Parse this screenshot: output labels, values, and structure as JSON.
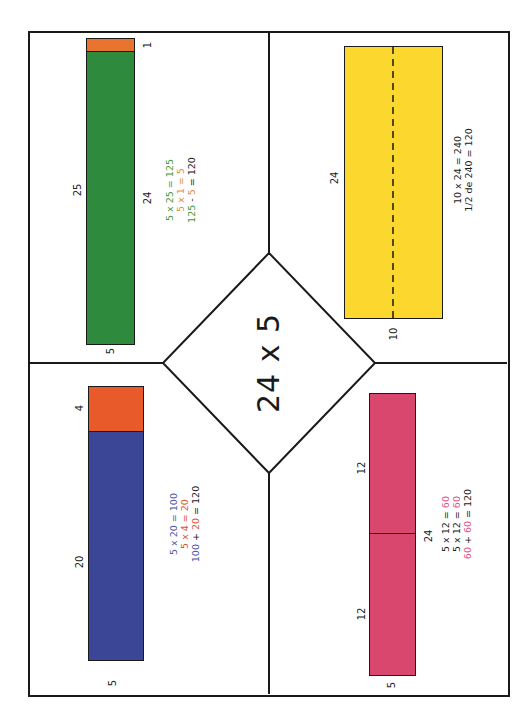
{
  "title": "24 x 5",
  "colors": {
    "green": "#2e8b3e",
    "orange": "#e8742e",
    "blue": "#3b4796",
    "red_orange": "#e85a2a",
    "yellow": "#fcd72e",
    "pink": "#d9466e",
    "line": "#1a1a1a",
    "text_green": "#3c9a3c",
    "text_orange": "#e88a3a",
    "text_blue": "#4b56a8",
    "text_red": "#e0502a",
    "text_pink": "#e0508a"
  },
  "quadrants": {
    "top_left": {
      "strategy": "compensation",
      "labels": {
        "length": "25",
        "width": "5",
        "extra": "1",
        "target": "24"
      },
      "equations": [
        {
          "parts": [
            {
              "t": "5 x ",
              "c": "text_green"
            },
            {
              "t": "25",
              "c": "text_green"
            },
            {
              "t": " = ",
              "c": "text_green"
            },
            {
              "t": "125",
              "c": "text_green"
            }
          ]
        },
        {
          "parts": [
            {
              "t": "5 x 1 = ",
              "c": "text_orange"
            },
            {
              "t": "5",
              "c": "text_orange"
            }
          ]
        },
        {
          "parts": [
            {
              "t": "125",
              "c": "text_green"
            },
            {
              "t": " - ",
              "c": "dark"
            },
            {
              "t": "5",
              "c": "text_orange"
            },
            {
              "t": " = 120",
              "c": "dark"
            }
          ]
        }
      ]
    },
    "bottom_left": {
      "strategy": "decomposition",
      "labels": {
        "part1": "20",
        "part2": "4",
        "width": "5"
      },
      "equations": [
        {
          "parts": [
            {
              "t": "5 x 20 = 100",
              "c": "text_blue"
            }
          ]
        },
        {
          "parts": [
            {
              "t": "5 x 4 = 20",
              "c": "text_red"
            }
          ]
        },
        {
          "parts": [
            {
              "t": "100",
              "c": "text_blue"
            },
            {
              "t": " + ",
              "c": "dark"
            },
            {
              "t": "20",
              "c": "text_red"
            },
            {
              "t": " = 120",
              "c": "dark"
            }
          ]
        }
      ]
    },
    "top_right": {
      "strategy": "doubling_and_halving",
      "labels": {
        "length": "24",
        "width": "10"
      },
      "equations": [
        {
          "parts": [
            {
              "t": "10 x 24 = 240",
              "c": "dark"
            }
          ]
        },
        {
          "parts": [
            {
              "t": "1/2 de 240 = 120",
              "c": "dark"
            }
          ]
        }
      ]
    },
    "bottom_right": {
      "strategy": "halving",
      "labels": {
        "half1": "12",
        "half2": "12",
        "total": "24",
        "width": "5"
      },
      "equations": [
        {
          "parts": [
            {
              "t": "5 x 12 = ",
              "c": "dark"
            },
            {
              "t": "60",
              "c": "text_pink"
            }
          ]
        },
        {
          "parts": [
            {
              "t": "5 x 12 = ",
              "c": "dark"
            },
            {
              "t": "60",
              "c": "text_pink"
            }
          ]
        },
        {
          "parts": [
            {
              "t": "60",
              "c": "text_pink"
            },
            {
              "t": " + ",
              "c": "dark"
            },
            {
              "t": "60",
              "c": "text_pink"
            },
            {
              "t": " = 120",
              "c": "dark"
            }
          ]
        }
      ]
    }
  }
}
